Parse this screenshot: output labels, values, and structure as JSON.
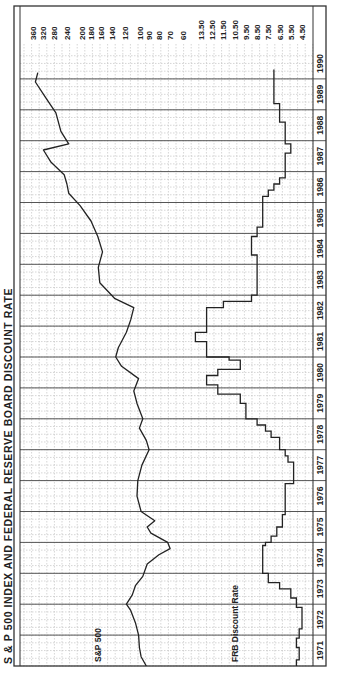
{
  "chart_data": {
    "type": "line",
    "title": "S & P 500 INDEX AND FEDERAL RESERVE BOARD DISCOUNT RATE",
    "orientation": "rotated-90 (time runs bottom to top)",
    "x_axis": {
      "label": "Year",
      "ticks": [
        "1971",
        "1972",
        "1973",
        "1974",
        "1975",
        "1976",
        "1977",
        "1978",
        "1979",
        "1980",
        "1981",
        "1982",
        "1983",
        "1984",
        "1985",
        "1986",
        "1987",
        "1988",
        "1989",
        "1990"
      ]
    },
    "sp500_axis": {
      "scale": "log",
      "ticks": [
        360,
        320,
        280,
        240,
        200,
        180,
        160,
        140,
        120,
        100,
        90,
        80,
        70,
        60
      ]
    },
    "rate_axis": {
      "ticks": [
        "13.50",
        "12.50",
        "11.50",
        "10.50",
        "9.50",
        "8.50",
        "7.50",
        "6.50",
        "5.50",
        "4.50"
      ]
    },
    "series": [
      {
        "name": "S&P 500",
        "label": "S&P 500",
        "points": [
          [
            1971.0,
            93
          ],
          [
            1971.3,
            99
          ],
          [
            1971.6,
            101
          ],
          [
            1972.0,
            102
          ],
          [
            1972.4,
            106
          ],
          [
            1972.8,
            112
          ],
          [
            1973.0,
            118
          ],
          [
            1973.3,
            110
          ],
          [
            1973.6,
            106
          ],
          [
            1973.9,
            97
          ],
          [
            1974.3,
            92
          ],
          [
            1974.6,
            80
          ],
          [
            1974.8,
            70
          ],
          [
            1975.0,
            72
          ],
          [
            1975.3,
            88
          ],
          [
            1975.5,
            92
          ],
          [
            1975.7,
            84
          ],
          [
            1976.0,
            99
          ],
          [
            1976.5,
            104
          ],
          [
            1977.0,
            103
          ],
          [
            1977.5,
            98
          ],
          [
            1978.0,
            90
          ],
          [
            1978.3,
            93
          ],
          [
            1978.7,
            101
          ],
          [
            1979.0,
            97
          ],
          [
            1979.5,
            104
          ],
          [
            1979.9,
            108
          ],
          [
            1980.3,
            102
          ],
          [
            1980.7,
            125
          ],
          [
            1981.0,
            134
          ],
          [
            1981.3,
            130
          ],
          [
            1981.8,
            118
          ],
          [
            1982.2,
            112
          ],
          [
            1982.6,
            108
          ],
          [
            1982.9,
            136
          ],
          [
            1983.4,
            162
          ],
          [
            1983.9,
            165
          ],
          [
            1984.4,
            157
          ],
          [
            1984.9,
            166
          ],
          [
            1985.4,
            180
          ],
          [
            1985.9,
            205
          ],
          [
            1986.3,
            235
          ],
          [
            1986.6,
            240
          ],
          [
            1986.9,
            248
          ],
          [
            1987.3,
            290
          ],
          [
            1987.7,
            318
          ],
          [
            1987.9,
            235
          ],
          [
            1988.3,
            258
          ],
          [
            1988.9,
            274
          ],
          [
            1989.4,
            310
          ],
          [
            1989.9,
            350
          ],
          [
            1990.2,
            340
          ]
        ]
      },
      {
        "name": "FRB Discount Rate",
        "label": "FRB Discount Rate",
        "steps": [
          [
            1971.0,
            5.0
          ],
          [
            1971.2,
            4.75
          ],
          [
            1971.6,
            5.0
          ],
          [
            1971.9,
            4.75
          ],
          [
            1972.2,
            4.5
          ],
          [
            1972.9,
            5.0
          ],
          [
            1973.2,
            5.5
          ],
          [
            1973.5,
            6.5
          ],
          [
            1973.7,
            7.5
          ],
          [
            1974.0,
            8.0
          ],
          [
            1974.9,
            7.75
          ],
          [
            1975.0,
            7.25
          ],
          [
            1975.2,
            6.75
          ],
          [
            1975.5,
            6.25
          ],
          [
            1975.9,
            6.0
          ],
          [
            1976.9,
            5.25
          ],
          [
            1977.6,
            5.75
          ],
          [
            1977.8,
            6.0
          ],
          [
            1978.0,
            6.5
          ],
          [
            1978.4,
            7.25
          ],
          [
            1978.6,
            7.75
          ],
          [
            1978.8,
            8.5
          ],
          [
            1979.0,
            9.5
          ],
          [
            1979.5,
            10.0
          ],
          [
            1979.8,
            12.0
          ],
          [
            1980.1,
            13.0
          ],
          [
            1980.4,
            12.0
          ],
          [
            1980.6,
            10.0
          ],
          [
            1980.9,
            11.0
          ],
          [
            1981.0,
            13.0
          ],
          [
            1981.5,
            14.0
          ],
          [
            1981.8,
            13.0
          ],
          [
            1982.6,
            11.5
          ],
          [
            1982.8,
            9.0
          ],
          [
            1983.0,
            8.5
          ],
          [
            1984.3,
            9.0
          ],
          [
            1984.9,
            8.5
          ],
          [
            1985.2,
            8.0
          ],
          [
            1986.2,
            7.5
          ],
          [
            1986.4,
            7.0
          ],
          [
            1986.6,
            6.5
          ],
          [
            1986.8,
            6.0
          ],
          [
            1987.6,
            5.5
          ],
          [
            1987.9,
            6.0
          ],
          [
            1988.6,
            6.5
          ],
          [
            1989.2,
            7.0
          ],
          [
            1990.3,
            7.0
          ]
        ]
      }
    ],
    "grid": true,
    "legend": "inline labels"
  }
}
